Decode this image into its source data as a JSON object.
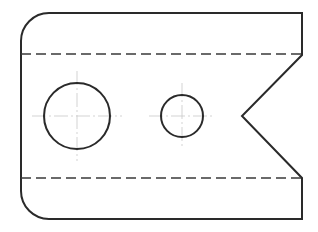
{
  "drawing": {
    "type": "orthographic-plate-view",
    "colors": {
      "background": "#ffffff",
      "outline": "#2a2a2a",
      "hidden_line": "#3a3a3a",
      "centerline": "#c8c8c8"
    },
    "outline": {
      "left": 21,
      "top": 13,
      "right": 302,
      "bottom": 219,
      "left_corner_radius": 28,
      "notch": {
        "top": [
          302,
          55
        ],
        "vertex": [
          242,
          116
        ],
        "bottom": [
          302,
          178
        ]
      }
    },
    "hidden_lines": [
      {
        "name": "top-hidden-line",
        "y": 54,
        "x1": 21,
        "x2": 302
      },
      {
        "name": "bottom-hidden-line",
        "y": 178,
        "x1": 21,
        "x2": 302
      }
    ],
    "holes": [
      {
        "name": "large-hole",
        "cx": 77,
        "cy": 116,
        "r": 33
      },
      {
        "name": "small-hole",
        "cx": 182,
        "cy": 116,
        "r": 21
      }
    ]
  }
}
